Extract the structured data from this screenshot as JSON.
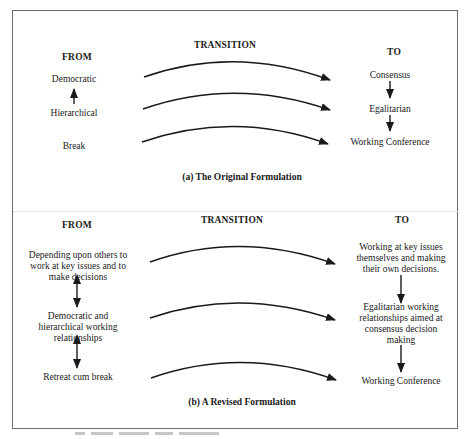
{
  "panels": [
    {
      "headers": {
        "from": "FROM",
        "transition": "TRANSITION",
        "to": "TO"
      },
      "from_items": [
        "Democratic",
        "Hierarchical",
        "Break"
      ],
      "to_items": [
        "Consensus",
        "Egalitarian",
        "Working Conference"
      ],
      "caption": "(a) The Original Formulation"
    },
    {
      "headers": {
        "from": "FROM",
        "transition": "TRANSITION",
        "to": "TO"
      },
      "from_items": [
        "Depending upon others to work at key issues and to make decisions",
        "Democratic and hierarchical working relationships",
        "Retreat cum break"
      ],
      "to_items": [
        "Working at key issues themselves and making their own decisions.",
        "Egalitarian working relationships aimed at consensus decision making",
        "Working Conference"
      ],
      "caption": "(b) A Revised Formulation"
    }
  ],
  "colors": {
    "ink": "#1a1a1a",
    "frame": "#6b6b6b",
    "background": "#ffffff"
  }
}
